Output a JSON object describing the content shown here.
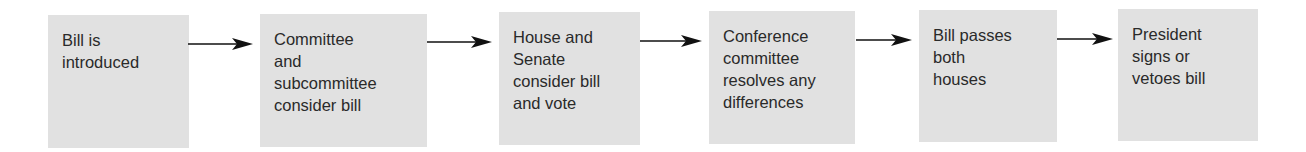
{
  "diagram": {
    "type": "flowchart",
    "direction": "left-to-right",
    "steps": [
      {
        "label": "Bill is\nintroduced"
      },
      {
        "label": "Committee\nand\nsubcommittee\nconsider bill"
      },
      {
        "label": "House and\nSenate\nconsider bill\nand vote"
      },
      {
        "label": "Conference\ncommittee\nresolves any\ndifferences"
      },
      {
        "label": "Bill passes\nboth\nhouses"
      },
      {
        "label": "President\nsigns or\nvetoes bill"
      }
    ],
    "colors": {
      "box_fill": "#e1e1e1",
      "text": "#2a2a2a",
      "arrow": "#111111"
    }
  }
}
